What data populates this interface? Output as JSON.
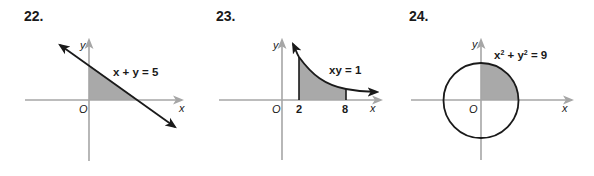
{
  "problems": [
    {
      "number": "22.",
      "equation": "x + y = 5",
      "curve_type": "line",
      "shaded_region": "triangle bounded by line and positive axes",
      "axis_labels": {
        "x": "x",
        "y": "y",
        "origin": "O"
      }
    },
    {
      "number": "23.",
      "equation": "xy = 1",
      "curve_type": "hyperbola",
      "shaded_region": "area under curve from x = 2 to x = 8",
      "tick_labels": [
        "2",
        "8"
      ],
      "axis_labels": {
        "x": "x",
        "y": "y",
        "origin": "O"
      }
    },
    {
      "number": "24.",
      "equation_base": "x",
      "equation_parts": [
        "x",
        "2",
        " + ",
        "y",
        "2",
        " = 9"
      ],
      "equation": "x² + y² = 9",
      "curve_type": "circle",
      "shaded_region": "first-quadrant quarter disk",
      "axis_labels": {
        "x": "x",
        "y": "y",
        "origin": "O"
      }
    }
  ],
  "colors": {
    "axis": "#a6a6a6",
    "curve": "#1a1a1a",
    "shade": "#a9a9a9",
    "text": "#1a1a1a"
  }
}
